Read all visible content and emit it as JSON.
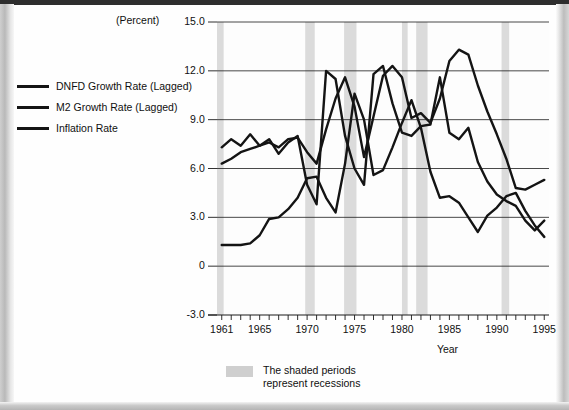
{
  "figure": {
    "unit_label": "(Percent)",
    "recession_caption": "The shaded periods\nrepresent recessions"
  },
  "legend": {
    "items": [
      {
        "label": "DNFD Growth Rate (Lagged)",
        "color": "#141414"
      },
      {
        "label": "M2 Growth Rate (Lagged)",
        "color": "#141414"
      },
      {
        "label": "Inflation Rate",
        "color": "#141414"
      }
    ]
  },
  "chart_data": {
    "type": "line",
    "title": "",
    "subtitle": "",
    "xlabel": "Year",
    "ylabel": "(Percent)",
    "xlim": [
      1960.5,
      1995.5
    ],
    "ylim": [
      -3.0,
      15.0
    ],
    "grid": true,
    "legend_position": "upper-left-outside",
    "ytick_labels": [
      "15.0",
      "12.0",
      "9.0",
      "6.0",
      "3.0",
      "0",
      "-3.0"
    ],
    "ytick_values": [
      15.0,
      12.0,
      9.0,
      6.0,
      3.0,
      0,
      -3.0
    ],
    "xtick_labels": [
      "1961",
      "1965",
      "1970",
      "1975",
      "1980",
      "1985",
      "1990",
      "1995"
    ],
    "xtick_values": [
      1961,
      1965,
      1970,
      1975,
      1980,
      1985,
      1990,
      1995
    ],
    "x": [
      1961,
      1962,
      1963,
      1964,
      1965,
      1966,
      1967,
      1968,
      1969,
      1970,
      1971,
      1972,
      1973,
      1974,
      1975,
      1976,
      1977,
      1978,
      1979,
      1980,
      1981,
      1982,
      1983,
      1984,
      1985,
      1986,
      1987,
      1988,
      1989,
      1990,
      1991,
      1992,
      1993,
      1994,
      1995
    ],
    "series": [
      {
        "name": "DNFD Growth Rate (Lagged)",
        "color": "#141414",
        "values": [
          6.3,
          6.6,
          7.0,
          7.2,
          7.4,
          7.6,
          7.3,
          7.8,
          7.9,
          7.0,
          6.3,
          8.4,
          10.3,
          11.6,
          9.8,
          6.7,
          9.2,
          11.7,
          12.3,
          11.6,
          9.1,
          9.4,
          8.8,
          10.3,
          12.6,
          13.3,
          13.0,
          11.1,
          9.5,
          8.1,
          6.6,
          4.8,
          4.7,
          5.0,
          5.3
        ]
      },
      {
        "name": "M2 Growth Rate (Lagged)",
        "color": "#141414",
        "values": [
          7.3,
          7.8,
          7.4,
          8.1,
          7.4,
          7.8,
          6.9,
          7.6,
          8.0,
          5.0,
          3.8,
          12.0,
          11.5,
          8.0,
          6.0,
          5.0,
          11.8,
          12.3,
          10.0,
          8.2,
          8.0,
          8.6,
          8.7,
          11.6,
          8.2,
          7.8,
          8.5,
          6.4,
          5.2,
          4.4,
          4.0,
          3.7,
          2.8,
          2.2,
          2.8
        ]
      },
      {
        "name": "Inflation Rate",
        "color": "#141414",
        "values": [
          1.3,
          1.3,
          1.3,
          1.4,
          1.9,
          2.9,
          3.0,
          3.5,
          4.2,
          5.4,
          5.5,
          4.2,
          3.3,
          6.3,
          10.6,
          9.0,
          5.6,
          5.9,
          7.3,
          8.8,
          10.2,
          8.5,
          5.8,
          4.2,
          4.3,
          3.9,
          3.0,
          2.1,
          3.1,
          3.6,
          4.3,
          4.5,
          3.4,
          2.5,
          1.8
        ]
      }
    ],
    "recessions": [
      {
        "start": 1960.4,
        "end": 1961.2
      },
      {
        "start": 1969.8,
        "end": 1970.8
      },
      {
        "start": 1973.9,
        "end": 1975.2
      },
      {
        "start": 1980.0,
        "end": 1980.6
      },
      {
        "start": 1981.5,
        "end": 1982.7
      },
      {
        "start": 1990.5,
        "end": 1991.3
      }
    ]
  }
}
